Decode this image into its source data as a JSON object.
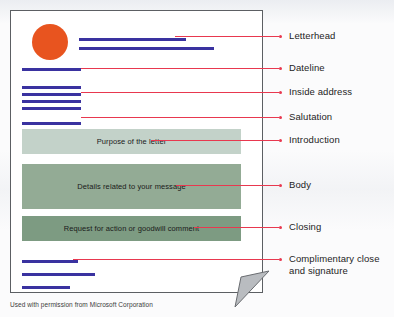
{
  "figure": {
    "credit": "Used with permission from Microsoft Corporation"
  },
  "colors": {
    "logo_orange": "#e8541f",
    "text_line_blue": "#3a32a0",
    "leader_red": "#e8384f",
    "block_intro_green": "#c3d2c9",
    "block_body_green": "#93ab95",
    "block_closing_green": "#7d9b82",
    "page_border": "#5c5f63",
    "fold_gray": "#b9bcc0"
  },
  "letter": {
    "blocks": [
      {
        "key": "introduction",
        "label": "Purpose of the letter"
      },
      {
        "key": "body",
        "label": "Details related to your message"
      },
      {
        "key": "closing",
        "label": "Request for action or goodwill comment"
      }
    ]
  },
  "callouts": [
    {
      "key": "letterhead",
      "label": "Letterhead"
    },
    {
      "key": "dateline",
      "label": "Dateline"
    },
    {
      "key": "inside-address",
      "label": "Inside address"
    },
    {
      "key": "salutation",
      "label": "Salutation"
    },
    {
      "key": "introduction",
      "label": "Introduction"
    },
    {
      "key": "body",
      "label": "Body"
    },
    {
      "key": "closing",
      "label": "Closing"
    },
    {
      "key": "complimentary-close",
      "label": "Complimentary close\nand signature"
    }
  ]
}
